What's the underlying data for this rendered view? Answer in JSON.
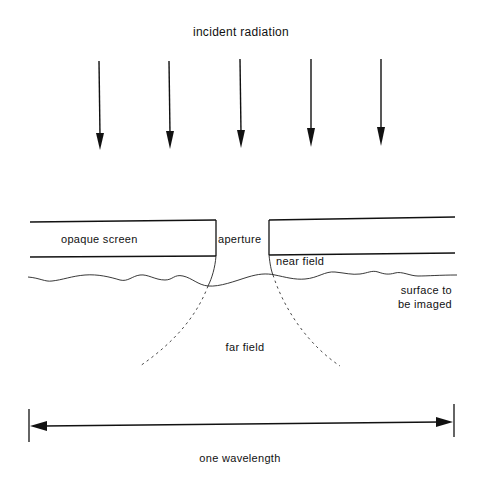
{
  "diagram": {
    "title": "incident radiation",
    "labels": {
      "opaque_screen": "opaque screen",
      "aperture": "aperture",
      "near_field": "near field",
      "far_field": "far field",
      "surface_line1": "surface to",
      "surface_line2": "be imaged",
      "wavelength": "one wavelength"
    },
    "arrows": {
      "count": 5,
      "x_positions": [
        100,
        170,
        240,
        311,
        381
      ]
    },
    "colors": {
      "ink": "#111111",
      "background": "#ffffff"
    }
  }
}
